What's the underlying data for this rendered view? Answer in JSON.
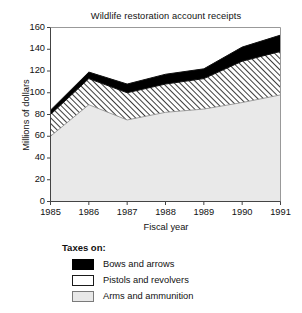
{
  "chart_data": {
    "type": "area",
    "title": "Wildlife restoration account receipts",
    "xlabel": "Fiscal year",
    "ylabel": "Millions of dollars",
    "stacked": true,
    "grid": false,
    "legend_position": "below-left",
    "x": [
      1985,
      1986,
      1987,
      1988,
      1989,
      1990,
      1991
    ],
    "categories": [
      "1985",
      "1986",
      "1987",
      "1988",
      "1989",
      "1990",
      "1991"
    ],
    "xlim": [
      1985,
      1991
    ],
    "ylim": [
      0,
      160
    ],
    "ytick_labels": [
      "0",
      "20",
      "40",
      "60",
      "80",
      "100",
      "120",
      "140",
      "160"
    ],
    "yticks": [
      0,
      20,
      40,
      60,
      80,
      100,
      120,
      140,
      160
    ],
    "xtick_labels": [
      "1985",
      "1986",
      "1987",
      "1988",
      "1989",
      "1990",
      "1991"
    ],
    "series": [
      {
        "name": "Arms and ammunition",
        "fill": "light-gray",
        "color": "#e8e8e8",
        "values": [
          60,
          89,
          75,
          82,
          85,
          91,
          98
        ]
      },
      {
        "name": "Pistols and revolvers",
        "fill": "diagonal-hatch",
        "color": "#ffffff",
        "values": [
          20,
          24,
          25,
          26,
          28,
          38,
          40
        ]
      },
      {
        "name": "Bows and arrows",
        "fill": "solid-black",
        "color": "#000000",
        "values": [
          4,
          6,
          8,
          9,
          9,
          13,
          15
        ]
      }
    ],
    "cumulative_tops": {
      "arms_and_ammunition": [
        60,
        89,
        75,
        82,
        85,
        91,
        98
      ],
      "plus_pistols_and_revolvers": [
        80,
        113,
        100,
        108,
        113,
        129,
        138
      ],
      "plus_bows_and_arrows": [
        84,
        119,
        108,
        117,
        122,
        142,
        153
      ]
    }
  },
  "legend": {
    "heading": "Taxes on:",
    "items": [
      {
        "label": "Bows and arrows",
        "swatch": "solid-black"
      },
      {
        "label": "Pistols and revolvers",
        "swatch": "diagonal-hatch"
      },
      {
        "label": "Arms and ammunition",
        "swatch": "light-gray"
      }
    ]
  }
}
